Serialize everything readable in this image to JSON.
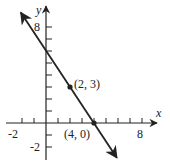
{
  "chart_data": {
    "type": "line",
    "title": "",
    "xlabel": "x",
    "ylabel": "y",
    "xlim": [
      -2.5,
      9.5
    ],
    "ylim": [
      -3,
      9.5
    ],
    "x_tick_step": 1,
    "y_tick_step": 1,
    "x_tick_labels": [
      {
        "value": -2,
        "label": "-2"
      },
      {
        "value": 8,
        "label": "8"
      }
    ],
    "y_tick_labels": [
      {
        "value": 8,
        "label": "8"
      },
      {
        "value": -2,
        "label": "-2"
      }
    ],
    "grid": false,
    "series": [
      {
        "name": "line",
        "equation": "y = -3/2 x + 6",
        "slope": -1.5,
        "intercept": 6,
        "endpoints": [
          [
            -2.1,
            9.2
          ],
          [
            5.9,
            -2.9
          ]
        ],
        "arrows": "both"
      }
    ],
    "points": [
      {
        "x": 2,
        "y": 3,
        "label": "(2, 3)"
      },
      {
        "x": 4,
        "y": 0,
        "label": "(4, 0)"
      }
    ],
    "color": "#222222"
  }
}
